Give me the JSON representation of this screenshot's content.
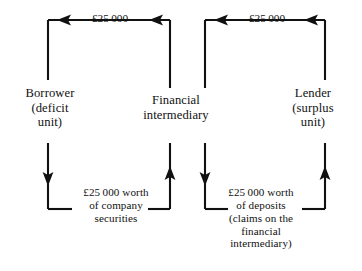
{
  "diagram": {
    "type": "financial-intermediation-flow",
    "background_color": "#ffffff",
    "stroke_color": "#111111",
    "nodes": [
      {
        "id": "borrower",
        "label": "Borrower\n(deficit\nunit)"
      },
      {
        "id": "financial-intermediary",
        "label": "Financial\nintermediary"
      },
      {
        "id": "lender",
        "label": "Lender\n(surplus\nunit)"
      }
    ],
    "flows": [
      {
        "id": "funds-to-borrower",
        "label": "£25 000",
        "direction": "right-to-left",
        "from": "financial-intermediary",
        "to": "borrower"
      },
      {
        "id": "funds-to-intermediary",
        "label": "£25 000",
        "direction": "right-to-left",
        "from": "lender",
        "to": "financial-intermediary"
      },
      {
        "id": "company-securities",
        "label": "£25 000 worth\nof company\nsecurities",
        "direction": "left-to-right",
        "from": "borrower",
        "to": "financial-intermediary"
      },
      {
        "id": "deposits",
        "label": "£25 000 worth\nof deposits\n(claims on the\nfinancial\nintermediary)",
        "direction": "left-to-right",
        "from": "financial-intermediary",
        "to": "lender"
      }
    ]
  }
}
